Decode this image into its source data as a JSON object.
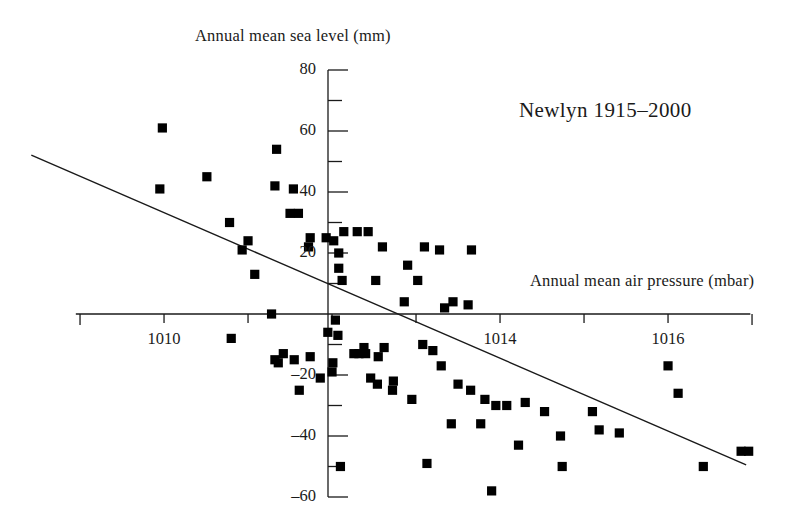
{
  "chart_data": {
    "type": "scatter",
    "title": "",
    "annotation": "Newlyn  1915–2000",
    "xlabel": "Annual mean air pressure (mbar)",
    "ylabel": "Annual mean sea level (mm)",
    "xlim": [
      1008.95,
      1016.98
    ],
    "ylim": [
      -60,
      80
    ],
    "xticks": [
      1009,
      1010,
      1011,
      1012,
      1013,
      1014,
      1015,
      1016,
      1017
    ],
    "xticklabels": [
      "",
      "1010",
      "",
      "",
      "",
      "1014",
      "",
      "1016",
      ""
    ],
    "yticks": [
      -60,
      -50,
      -40,
      -30,
      -20,
      -10,
      0,
      10,
      20,
      30,
      40,
      50,
      60,
      70,
      80
    ],
    "yticklabels": [
      "-60",
      "",
      "-40",
      "",
      "-20",
      "",
      "",
      "",
      "20",
      "",
      "40",
      "",
      "60",
      "",
      "80"
    ],
    "grid": false,
    "legend": null,
    "marker": "square",
    "marker_color": "#000000",
    "series": [
      {
        "name": "Annual means",
        "x": [
          1009.98,
          1009.95,
          1010.51,
          1010.78,
          1011.34,
          1011.0,
          1010.93,
          1011.32,
          1011.54,
          1011.6,
          1011.5,
          1011.08,
          1011.74,
          1011.93,
          1012.02,
          1011.72,
          1011.28,
          1012.14,
          1012.3,
          1012.6,
          1012.43,
          1012.08,
          1012.08,
          1012.12,
          1012.9,
          1013.1,
          1013.28,
          1012.52,
          1012.86,
          1013.02,
          1013.44,
          1013.34,
          1013.62,
          1013.66,
          1011.95,
          1012.07,
          1012.38,
          1012.04,
          1010.8,
          1011.42,
          1011.32,
          1011.36,
          1011.55,
          1011.74,
          1011.61,
          1012.01,
          1012.0,
          1012.32,
          1012.26,
          1012.4,
          1012.62,
          1012.55,
          1012.46,
          1012.73,
          1012.72,
          1013.08,
          1013.2,
          1013.3,
          1013.5,
          1013.65,
          1013.82,
          1013.95,
          1014.08,
          1013.42,
          1013.77,
          1014.3,
          1014.53,
          1014.22,
          1014.72,
          1015.1,
          1015.18,
          1015.42,
          1013.13,
          1013.9,
          1014.74,
          1016.0,
          1016.12,
          1016.42,
          1016.87,
          1016.96,
          1012.1,
          1012.54,
          1012.95,
          1011.86
        ],
        "y": [
          61,
          41,
          45,
          30,
          54,
          24,
          21,
          42,
          41,
          33,
          33,
          13,
          25,
          25,
          24,
          22,
          0,
          27,
          27,
          22,
          27,
          20,
          15,
          11,
          16,
          22,
          21,
          11,
          4,
          11,
          4,
          2,
          3,
          21,
          -6,
          -7,
          -11,
          -2,
          -8,
          -13,
          -15,
          -16,
          -15,
          -14,
          -25,
          -16,
          -19,
          -13,
          -13,
          -13,
          -11,
          -14,
          -21,
          -22,
          -25,
          -10,
          -12,
          -17,
          -23,
          -25,
          -28,
          -30,
          -30,
          -36,
          -36,
          -29,
          -32,
          -43,
          -40,
          -32,
          -38,
          -39,
          -49,
          -58,
          -50,
          -17,
          -26,
          -50,
          -45,
          -45,
          -50,
          -23,
          -28,
          -21
        ]
      }
    ],
    "fit_line": {
      "label": "least-squares regression line",
      "x_start": 1008.42,
      "y_start": 52.1,
      "x_end": 1016.93,
      "y_end": -49.5
    }
  },
  "axes": {
    "y_axis_ticks": [
      {
        "value": 80,
        "label": "80"
      },
      {
        "value": 70,
        "label": ""
      },
      {
        "value": 60,
        "label": "60"
      },
      {
        "value": 50,
        "label": ""
      },
      {
        "value": 40,
        "label": "40"
      },
      {
        "value": 30,
        "label": ""
      },
      {
        "value": 20,
        "label": "20"
      },
      {
        "value": 10,
        "label": ""
      },
      {
        "value": -10,
        "label": ""
      },
      {
        "value": -20,
        "label": "–20"
      },
      {
        "value": -30,
        "label": ""
      },
      {
        "value": -40,
        "label": "–40"
      },
      {
        "value": -50,
        "label": ""
      },
      {
        "value": -60,
        "label": "–60"
      }
    ],
    "x_axis_ticks": [
      {
        "value": 1009,
        "label": ""
      },
      {
        "value": 1010,
        "label": "1010"
      },
      {
        "value": 1011,
        "label": ""
      },
      {
        "value": 1012,
        "label": ""
      },
      {
        "value": 1013,
        "label": ""
      },
      {
        "value": 1014,
        "label": "1014"
      },
      {
        "value": 1015,
        "label": ""
      },
      {
        "value": 1016,
        "label": "1016"
      },
      {
        "value": 1017,
        "label": ""
      }
    ]
  }
}
